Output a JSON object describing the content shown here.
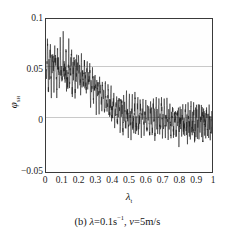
{
  "figure": {
    "caption_prefix": "(b)",
    "caption_lambda_symbol": "λ",
    "caption_lambda_eq": "=0.1s",
    "caption_lambda_exp": "−1",
    "caption_sep": ",",
    "caption_v_symbol": "v",
    "caption_v_eq": "=5m/s",
    "caption_full": "(b) λ=0.1s−1 , v=5m/s"
  },
  "axes": {
    "y_title_symbol": "φ",
    "y_title_sub": "sн",
    "x_title_symbol": "λ",
    "x_title_sub": "t",
    "y_ticks": [
      "0.1",
      "0.05",
      "0",
      "−0.05"
    ],
    "x_ticks": [
      "0",
      "0.1",
      "0.2",
      "0.3",
      "0.4",
      "0.5",
      "0.6",
      "0.7",
      "0.8",
      "0.9",
      "1"
    ]
  },
  "chart_data": {
    "type": "line",
    "xlabel": "λ_t",
    "ylabel": "φ_sн",
    "xlim": [
      0,
      1
    ],
    "ylim": [
      -0.05,
      0.1
    ],
    "grid": true,
    "gridlines_y": [
      0.05,
      0
    ],
    "legend_position": "none",
    "axis_frame": "box",
    "line_color": "#1a1a1a",
    "line_width": 0.6,
    "envelope": {
      "x": [
        0.0,
        0.1,
        0.2,
        0.3,
        0.4,
        0.5,
        0.6,
        0.7,
        0.8,
        0.9,
        1.0
      ],
      "mean": [
        0.052,
        0.05,
        0.043,
        0.028,
        0.012,
        0.006,
        0.004,
        0.002,
        0.0,
        -0.001,
        -0.002
      ],
      "upper": [
        0.1,
        0.096,
        0.083,
        0.06,
        0.04,
        0.036,
        0.032,
        0.03,
        0.026,
        0.026,
        0.024
      ],
      "lower": [
        0.004,
        0.006,
        0.006,
        0.0,
        -0.02,
        -0.03,
        -0.026,
        -0.032,
        -0.036,
        -0.048,
        -0.04
      ]
    },
    "x": [
      0.0,
      0.004,
      0.008,
      0.012,
      0.016,
      0.02,
      0.024,
      0.028,
      0.032,
      0.036,
      0.04,
      0.044,
      0.048,
      0.052,
      0.056,
      0.06,
      0.064,
      0.068,
      0.072,
      0.076,
      0.08,
      0.084,
      0.088,
      0.092,
      0.096,
      0.1,
      0.104,
      0.108,
      0.112,
      0.116,
      0.12,
      0.124,
      0.128,
      0.132,
      0.136,
      0.14,
      0.144,
      0.148,
      0.152,
      0.156,
      0.16,
      0.164,
      0.168,
      0.172,
      0.176,
      0.18,
      0.184,
      0.188,
      0.192,
      0.196,
      0.2,
      0.204,
      0.208,
      0.212,
      0.216,
      0.22,
      0.224,
      0.228,
      0.232,
      0.236,
      0.24,
      0.244,
      0.248,
      0.252,
      0.256,
      0.26,
      0.264,
      0.268,
      0.272,
      0.276,
      0.28,
      0.284,
      0.288,
      0.292,
      0.296,
      0.3,
      0.304,
      0.308,
      0.312,
      0.316,
      0.32,
      0.324,
      0.328,
      0.332,
      0.336,
      0.34,
      0.344,
      0.348,
      0.352,
      0.356,
      0.36,
      0.364,
      0.368,
      0.372,
      0.376,
      0.38,
      0.384,
      0.388,
      0.392,
      0.396,
      0.4,
      0.404,
      0.408,
      0.412,
      0.416,
      0.42,
      0.424,
      0.428,
      0.432,
      0.436,
      0.44,
      0.444,
      0.448,
      0.452,
      0.456,
      0.46,
      0.464,
      0.468,
      0.472,
      0.476,
      0.48,
      0.484,
      0.488,
      0.492,
      0.496,
      0.5,
      0.504,
      0.508,
      0.512,
      0.516,
      0.52,
      0.524,
      0.528,
      0.532,
      0.536,
      0.54,
      0.544,
      0.548,
      0.552,
      0.556,
      0.56,
      0.564,
      0.568,
      0.572,
      0.576,
      0.58,
      0.584,
      0.588,
      0.592,
      0.596,
      0.6,
      0.604,
      0.608,
      0.612,
      0.616,
      0.62,
      0.624,
      0.628,
      0.632,
      0.636,
      0.64,
      0.644,
      0.648,
      0.652,
      0.656,
      0.66,
      0.664,
      0.668,
      0.672,
      0.676,
      0.68,
      0.684,
      0.688,
      0.692,
      0.696,
      0.7,
      0.704,
      0.708,
      0.712,
      0.716,
      0.72,
      0.724,
      0.728,
      0.732,
      0.736,
      0.74,
      0.744,
      0.748,
      0.752,
      0.756,
      0.76,
      0.764,
      0.768,
      0.772,
      0.776,
      0.78,
      0.784,
      0.788,
      0.792,
      0.796,
      0.8,
      0.804,
      0.808,
      0.812,
      0.816,
      0.82,
      0.824,
      0.828,
      0.832,
      0.836,
      0.84,
      0.844,
      0.848,
      0.852,
      0.856,
      0.86,
      0.864,
      0.868,
      0.872,
      0.876,
      0.88,
      0.884,
      0.888,
      0.892,
      0.896,
      0.9,
      0.904,
      0.908,
      0.912,
      0.916,
      0.92,
      0.924,
      0.928,
      0.932,
      0.936,
      0.94,
      0.944,
      0.948,
      0.952,
      0.956,
      0.96,
      0.964,
      0.968,
      0.972,
      0.976,
      0.98,
      0.984,
      0.988,
      0.992,
      0.996,
      1.0
    ],
    "y": [
      0.012,
      0.058,
      0.097,
      0.055,
      0.02,
      0.062,
      0.095,
      0.048,
      0.016,
      0.07,
      0.09,
      0.036,
      0.022,
      0.078,
      0.099,
      0.042,
      0.01,
      0.052,
      0.086,
      0.044,
      0.024,
      0.074,
      0.092,
      0.03,
      0.018,
      0.066,
      0.096,
      0.05,
      0.026,
      0.06,
      0.082,
      0.038,
      0.014,
      0.054,
      0.094,
      0.046,
      0.028,
      0.072,
      0.088,
      0.034,
      0.02,
      0.064,
      0.091,
      0.04,
      0.012,
      0.056,
      0.084,
      0.048,
      0.03,
      0.076,
      0.086,
      0.026,
      0.016,
      0.068,
      0.083,
      0.036,
      0.022,
      0.058,
      0.08,
      0.032,
      0.014,
      0.05,
      0.078,
      0.044,
      0.024,
      0.062,
      0.076,
      0.018,
      0.008,
      0.046,
      0.072,
      0.03,
      0.012,
      0.054,
      0.07,
      0.022,
      0.0,
      0.036,
      0.06,
      0.028,
      0.01,
      0.044,
      0.058,
      0.02,
      0.004,
      0.038,
      0.056,
      0.024,
      -0.004,
      0.03,
      0.052,
      0.018,
      0.006,
      0.034,
      0.048,
      0.014,
      -0.008,
      0.026,
      0.044,
      0.01,
      -0.012,
      0.022,
      0.04,
      0.008,
      -0.016,
      0.018,
      0.038,
      0.006,
      -0.01,
      0.02,
      0.036,
      0.004,
      -0.02,
      0.014,
      0.034,
      0.002,
      -0.024,
      0.012,
      0.032,
      0.0,
      -0.018,
      0.016,
      0.03,
      -0.002,
      -0.028,
      0.01,
      0.036,
      0.004,
      -0.03,
      0.008,
      0.028,
      -0.004,
      -0.022,
      0.012,
      0.032,
      0.0,
      -0.026,
      0.006,
      0.03,
      0.002,
      -0.024,
      0.01,
      0.026,
      -0.006,
      -0.02,
      0.014,
      0.028,
      -0.002,
      -0.028,
      0.004,
      0.024,
      0.0,
      -0.018,
      0.008,
      0.03,
      0.002,
      -0.026,
      0.006,
      0.022,
      -0.004,
      -0.022,
      0.01,
      0.026,
      0.0,
      -0.03,
      0.002,
      0.028,
      0.004,
      -0.02,
      0.008,
      0.024,
      -0.002,
      -0.024,
      0.006,
      0.03,
      0.0,
      -0.028,
      0.004,
      0.022,
      -0.006,
      -0.018,
      0.01,
      0.026,
      0.002,
      -0.032,
      0.0,
      0.024,
      -0.004,
      -0.022,
      0.006,
      0.028,
      0.0,
      -0.026,
      0.004,
      0.02,
      -0.008,
      -0.02,
      0.008,
      0.024,
      -0.002,
      -0.03,
      0.002,
      0.026,
      0.0,
      -0.024,
      0.006,
      0.022,
      -0.004,
      -0.036,
      0.0,
      0.024,
      -0.006,
      -0.026,
      0.004,
      0.02,
      -0.002,
      -0.022,
      0.008,
      0.026,
      0.0,
      -0.03,
      0.002,
      0.022,
      -0.004,
      -0.04,
      0.0,
      0.024,
      -0.002,
      -0.028,
      0.006,
      0.02,
      -0.006,
      -0.024,
      0.004,
      0.026,
      0.0,
      -0.048,
      0.002,
      0.022,
      -0.004,
      -0.03,
      0.006,
      0.024,
      0.0,
      -0.026,
      0.004,
      0.02,
      -0.008,
      -0.034,
      0.002,
      0.024,
      -0.002,
      -0.028,
      0.008,
      0.022,
      -0.004,
      -0.04,
      0.0,
      0.024,
      -0.006,
      -0.018
    ]
  }
}
